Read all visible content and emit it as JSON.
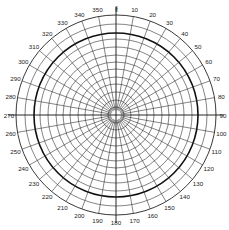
{
  "diagram": {
    "type": "polar-grid",
    "center": [
      116,
      115
    ],
    "outer_radius": 100,
    "bold_ring_radius": 82,
    "inner_ring_radii": [
      8,
      15,
      23,
      31,
      38,
      46,
      53,
      60,
      68,
      76,
      91
    ],
    "spoke_step_deg": 10,
    "axis_extension": 8,
    "north_marker": "∦",
    "angle_labels": [
      "350",
      "10",
      "20",
      "30",
      "40",
      "50",
      "60",
      "70",
      "80",
      "90",
      "100",
      "110",
      "120",
      "130",
      "140",
      "150",
      "160",
      "170",
      "180",
      "190",
      "200",
      "210",
      "220",
      "230",
      "240",
      "250",
      "260",
      "270",
      "280",
      "290",
      "300",
      "310",
      "320",
      "330",
      "340"
    ],
    "colors": {
      "line": "#333333",
      "bold": "#111111",
      "background": "#ffffff"
    }
  }
}
